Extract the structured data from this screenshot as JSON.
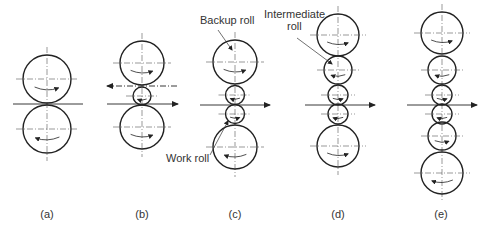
{
  "figure": {
    "panels": [
      {
        "id": "a",
        "caption": "(a)",
        "cx": 47,
        "rolls": [
          {
            "type": "work",
            "cy": 79,
            "r": 24
          },
          {
            "type": "work",
            "cy": 129,
            "r": 24
          }
        ],
        "arrows": [
          {
            "y": 104,
            "x1": 13,
            "x2": 83,
            "dir": "none"
          }
        ]
      },
      {
        "id": "b",
        "caption": "(b)",
        "cx": 142,
        "rolls": [
          {
            "type": "backup",
            "cy": 63,
            "r": 22
          },
          {
            "type": "work",
            "cy": 96,
            "r": 9
          },
          {
            "type": "backup",
            "cy": 127,
            "r": 22
          }
        ],
        "arrows": [
          {
            "y": 86,
            "x1": 107,
            "x2": 177,
            "dir": "left",
            "dashed": true
          },
          {
            "y": 104,
            "x1": 107,
            "x2": 178,
            "dir": "right"
          }
        ]
      },
      {
        "id": "c",
        "caption": "(c)",
        "cx": 235,
        "rolls": [
          {
            "type": "backup",
            "cy": 62,
            "r": 22
          },
          {
            "type": "work",
            "cy": 95,
            "r": 9.5
          },
          {
            "type": "work",
            "cy": 114,
            "r": 9.5
          },
          {
            "type": "backup",
            "cy": 147,
            "r": 22
          }
        ],
        "arrows": [
          {
            "y": 105,
            "x1": 200,
            "x2": 270,
            "dir": "right"
          }
        ]
      },
      {
        "id": "d",
        "caption": "(d)",
        "cx": 338,
        "rolls": [
          {
            "type": "backup",
            "cy": 35,
            "r": 21
          },
          {
            "type": "intermediate",
            "cy": 70,
            "r": 14
          },
          {
            "type": "work",
            "cy": 95,
            "r": 10
          },
          {
            "type": "work",
            "cy": 114,
            "r": 10
          },
          {
            "type": "backup",
            "cy": 146,
            "r": 21
          }
        ],
        "arrows": [
          {
            "y": 105,
            "x1": 305,
            "x2": 375,
            "dir": "right"
          }
        ]
      },
      {
        "id": "e",
        "caption": "(e)",
        "cx": 442,
        "rolls": [
          {
            "type": "backup",
            "cy": 33,
            "r": 21
          },
          {
            "type": "intermediate",
            "cy": 70,
            "r": 14
          },
          {
            "type": "work",
            "cy": 95,
            "r": 10
          },
          {
            "type": "work",
            "cy": 114,
            "r": 10
          },
          {
            "type": "intermediate",
            "cy": 136,
            "r": 14
          },
          {
            "type": "backup",
            "cy": 173,
            "r": 21
          }
        ],
        "arrows": [
          {
            "y": 105,
            "x1": 407,
            "x2": 477,
            "dir": "right"
          }
        ]
      }
    ],
    "annotations": {
      "backup_roll": "Backup roll",
      "work_roll": "Work roll",
      "intermediate_line1": "Intermediate",
      "intermediate_line2": "roll"
    },
    "captions": {
      "a": "(a)",
      "b": "(b)",
      "c": "(c)",
      "d": "(d)",
      "e": "(e)"
    },
    "colors": {
      "stroke": "#222222",
      "text": "#333333",
      "background": "#ffffff"
    }
  }
}
